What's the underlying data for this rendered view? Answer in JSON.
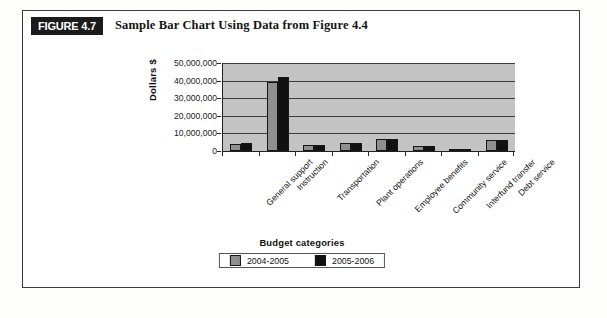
{
  "figure": {
    "badge": "FIGURE 4.7",
    "title": "Sample Bar Chart Using Data from Figure 4.4"
  },
  "legend": {
    "position": "bottom",
    "items": [
      {
        "label": "2004-2005",
        "color": "#8f8f8f"
      },
      {
        "label": "2005-2006",
        "color": "#111111"
      }
    ]
  },
  "chart_data": {
    "type": "bar",
    "title": "Sample Bar Chart Using Data from Figure 4.4",
    "xlabel": "Budget categories",
    "ylabel": "Dollars $",
    "ylim": [
      0,
      50000000
    ],
    "ytick_labels": [
      "50,000,000",
      "40,000,000",
      "30,000,000",
      "20,000,000",
      "10,000,000",
      "0"
    ],
    "ytick_values": [
      50000000,
      40000000,
      30000000,
      20000000,
      10000000,
      0
    ],
    "grid": true,
    "categories": [
      "General support",
      "Instruction",
      "Transportation",
      "Plant operations",
      "Employee benefits",
      "Community service",
      "Interfund transfer",
      "Debt service"
    ],
    "series": [
      {
        "name": "2004-2005",
        "color": "#8f8f8f",
        "values": [
          4200000,
          39000000,
          3400000,
          4300000,
          6800000,
          2700000,
          700000,
          6200000
        ]
      },
      {
        "name": "2005-2006",
        "color": "#111111",
        "values": [
          4400000,
          42000000,
          3600000,
          4500000,
          7000000,
          2800000,
          750000,
          6300000
        ]
      }
    ]
  }
}
